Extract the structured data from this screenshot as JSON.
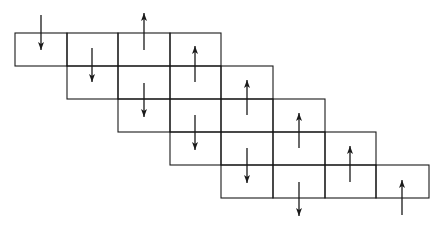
{
  "diagram": {
    "type": "staggered-spin-lattice",
    "line_color": "#1a1a1a",
    "background": "#ffffff",
    "grid": {
      "x_lines": [
        15,
        67,
        118,
        170,
        221,
        273,
        325,
        376,
        429
      ],
      "y_lines": [
        33,
        66,
        99,
        132,
        165,
        198
      ],
      "rows": [
        {
          "row": 0,
          "col_start": 0,
          "col_end": 4
        },
        {
          "row": 1,
          "col_start": 1,
          "col_end": 5
        },
        {
          "row": 2,
          "col_start": 2,
          "col_end": 6
        },
        {
          "row": 3,
          "col_start": 3,
          "col_end": 7
        },
        {
          "row": 4,
          "col_start": 4,
          "col_end": 8
        }
      ]
    },
    "arrows": [
      {
        "x": 41,
        "y1": 15,
        "y2": 50,
        "dir": "down"
      },
      {
        "x": 92,
        "y1": 48,
        "y2": 82,
        "dir": "down"
      },
      {
        "x": 144,
        "y1": 50,
        "y2": 13,
        "dir": "up"
      },
      {
        "x": 144,
        "y1": 83,
        "y2": 117,
        "dir": "down"
      },
      {
        "x": 195,
        "y1": 82,
        "y2": 46,
        "dir": "up"
      },
      {
        "x": 195,
        "y1": 115,
        "y2": 150,
        "dir": "down"
      },
      {
        "x": 247,
        "y1": 115,
        "y2": 80,
        "dir": "up"
      },
      {
        "x": 247,
        "y1": 148,
        "y2": 183,
        "dir": "down"
      },
      {
        "x": 299,
        "y1": 148,
        "y2": 113,
        "dir": "up"
      },
      {
        "x": 299,
        "y1": 182,
        "y2": 216,
        "dir": "down"
      },
      {
        "x": 350,
        "y1": 182,
        "y2": 146,
        "dir": "up"
      },
      {
        "x": 402,
        "y1": 215,
        "y2": 180,
        "dir": "up"
      }
    ]
  }
}
